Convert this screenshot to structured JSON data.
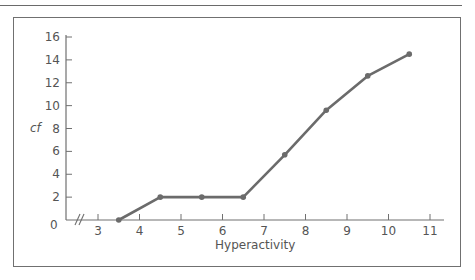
{
  "chart_data": {
    "type": "line",
    "title": "",
    "xlabel": "Hyperactivity",
    "ylabel": "cf",
    "x_ticks": [
      "3",
      "4",
      "5",
      "6",
      "7",
      "8",
      "9",
      "10",
      "11"
    ],
    "y_ticks": [
      "0",
      "2",
      "4",
      "6",
      "8",
      "10",
      "12",
      "14",
      "16"
    ],
    "xlim": [
      3,
      11
    ],
    "ylim": [
      0,
      16
    ],
    "axis_break": "x-axis break between 0 and 3",
    "grid": false,
    "series": [
      {
        "name": "cf",
        "x": [
          3.5,
          4.5,
          5.5,
          6.5,
          7.5,
          8.5,
          9.5,
          10.5
        ],
        "values": [
          0,
          2,
          2,
          2,
          5.7,
          9.6,
          12.6,
          14.5
        ]
      }
    ]
  },
  "labels": {
    "xlabel": "Hyperactivity",
    "ylabel": "cf",
    "origin": "0"
  },
  "colors": {
    "line": "#6b6b6b",
    "axis": "#707070",
    "text": "#555555"
  }
}
